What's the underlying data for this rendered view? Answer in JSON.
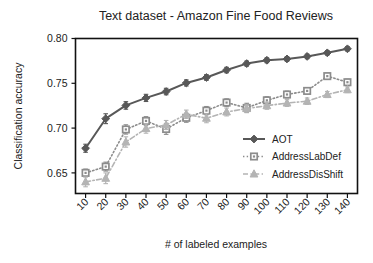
{
  "chart_data": {
    "type": "line",
    "title": "Text dataset - Amazon Fine Food Reviews",
    "xlabel": "# of labeled examples",
    "ylabel": "Classification accuracy",
    "x": [
      10,
      20,
      30,
      40,
      50,
      60,
      70,
      80,
      90,
      100,
      110,
      120,
      130,
      140
    ],
    "xtick_labels": [
      "10",
      "20",
      "30",
      "40",
      "50",
      "60",
      "70",
      "80",
      "90",
      "100",
      "110",
      "120",
      "130",
      "140"
    ],
    "ytick_labels": [
      "0.65",
      "0.70",
      "0.75",
      "0.80"
    ],
    "yticks": [
      0.65,
      0.7,
      0.75,
      0.8
    ],
    "ylim": [
      0.627,
      0.8
    ],
    "xlim": [
      5,
      145
    ],
    "grid": false,
    "legend_position": "lower right",
    "series": [
      {
        "name": "AOT",
        "color": "#585858",
        "marker": "diamond",
        "linestyle": "solid",
        "values": [
          0.6775,
          0.7105,
          0.7253,
          0.7337,
          0.7408,
          0.7504,
          0.7565,
          0.7648,
          0.772,
          0.7757,
          0.7772,
          0.78,
          0.784,
          0.7885
        ],
        "errors": [
          0.0045,
          0.0055,
          0.0042,
          0.004,
          0.0036,
          0.0034,
          0.0032,
          0.003,
          0.0028,
          0.0027,
          0.0026,
          0.0025,
          0.0024,
          0.0024
        ]
      },
      {
        "name": "AddressLabDef",
        "color": "#8c8c8c",
        "marker": "square",
        "linestyle": "dotted",
        "values": [
          0.65,
          0.657,
          0.6985,
          0.708,
          0.699,
          0.7115,
          0.7195,
          0.7285,
          0.7225,
          0.731,
          0.7375,
          0.7415,
          0.758,
          0.7512
        ],
        "errors": [
          0.0043,
          0.005,
          0.0052,
          0.0048,
          0.006,
          0.005,
          0.0046,
          0.0042,
          0.0052,
          0.004,
          0.0038,
          0.0036,
          0.0034,
          0.0034
        ]
      },
      {
        "name": "AddressDisShift",
        "color": "#b4b4b4",
        "marker": "triangle",
        "linestyle": "dashdot",
        "values": [
          0.64,
          0.644,
          0.6845,
          0.6995,
          0.7035,
          0.7155,
          0.711,
          0.718,
          0.7218,
          0.725,
          0.728,
          0.73,
          0.7375,
          0.7428
        ],
        "errors": [
          0.0055,
          0.006,
          0.0058,
          0.0052,
          0.005,
          0.0046,
          0.005,
          0.0044,
          0.0042,
          0.004,
          0.0038,
          0.0036,
          0.0034,
          0.0032
        ]
      }
    ]
  },
  "figure": {
    "background": "#ffffff",
    "axis_color": "#111111"
  }
}
